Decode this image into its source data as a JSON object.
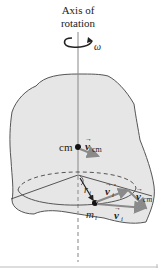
{
  "figure": {
    "axis_label_line1": "Axis of",
    "axis_label_line2": "rotation",
    "omega": "ω",
    "cm_label": "cm",
    "v_cm_symbol": "v",
    "v_cm_sub": "cm",
    "v_i_prime_symbol": "v",
    "v_i_prime_sub": "i",
    "v_i_prime_mark": "′",
    "v_cm2_symbol": "v",
    "v_cm2_sub": "cm",
    "v_i_symbol": "v",
    "v_i_sub": "i",
    "r_i_symbol": "r",
    "r_i_sub": "i",
    "m_i_symbol": "m",
    "m_i_sub": "i",
    "arrow_mark": "→"
  },
  "colors": {
    "body_fill": "#e6e6e6",
    "outline": "#555555",
    "vector_gray": "#8a8a8a",
    "axis_line": "#888888"
  }
}
